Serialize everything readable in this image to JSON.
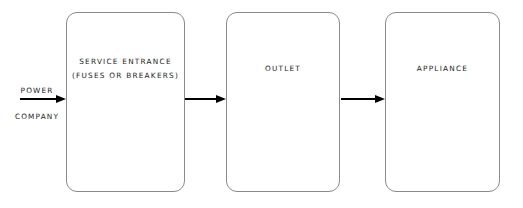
{
  "diagram": {
    "background_color": "#ffffff",
    "stroke_color": "#8a8a8a",
    "arrow_color": "#000000",
    "text_color": "#1c1c1c",
    "source": {
      "line1": "POWER",
      "line2": "COMPANY"
    },
    "nodes": [
      {
        "id": "service-entrance",
        "line1": "SERVICE ENTRANCE",
        "line2": "(FUSES OR BREAKERS)"
      },
      {
        "id": "outlet",
        "line1": "OUTLET",
        "line2": ""
      },
      {
        "id": "appliance",
        "line1": "APPLIANCE",
        "line2": ""
      }
    ],
    "arrows": [
      {
        "id": "source-to-service-entrance",
        "from": "power-company",
        "to": "service-entrance"
      },
      {
        "id": "service-entrance-to-outlet",
        "from": "service-entrance",
        "to": "outlet"
      },
      {
        "id": "outlet-to-appliance",
        "from": "outlet",
        "to": "appliance"
      }
    ]
  }
}
